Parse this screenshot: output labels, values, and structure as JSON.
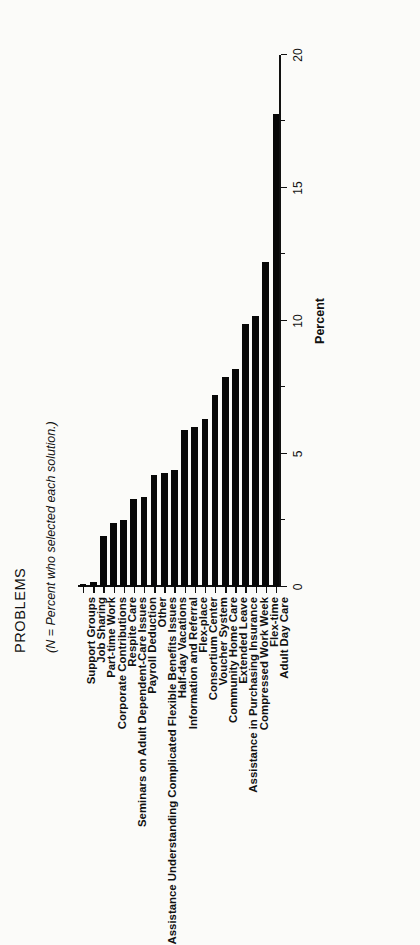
{
  "figure": {
    "title": "PROBLEMS",
    "subtitle": "(N = Percent who selected each solution.)"
  },
  "chart_data": {
    "type": "bar",
    "orientation": "horizontal",
    "title": "PROBLEMS",
    "subtitle": "(N = Percent who selected each solution.)",
    "xlabel": "",
    "ylabel": "Percent",
    "ylim": [
      0,
      20
    ],
    "yticks": [
      0,
      5,
      10,
      15,
      20
    ],
    "ytick_labels": [
      "0",
      "5",
      "10",
      "15",
      "20"
    ],
    "grid": false,
    "legend": false,
    "bar_color": "#080808",
    "categories": [
      "Adult Day Care",
      "Flex-time",
      "Compressed Work Week",
      "Assistance in Purchasing Insurance",
      "Extended Leave",
      "Community Home Care",
      "Voucher System",
      "Consortium Center",
      "Flex-place",
      "Information and Referral",
      "Half-day Vacations",
      "Assistance Understanding Complicated Flexible Benefits Issues",
      "Other",
      "Payroll Deduction",
      "Seminars on Adult Dependent-Care Issues",
      "Respite Care",
      "Corporate Contributions",
      "Part-time Work",
      "Job Sharing",
      "Support Groups"
    ],
    "values": [
      17.8,
      12.2,
      10.2,
      9.9,
      8.2,
      7.9,
      7.2,
      6.3,
      6.0,
      5.9,
      4.4,
      4.3,
      4.2,
      3.4,
      3.3,
      2.5,
      2.4,
      1.9,
      0.2,
      0.1
    ]
  }
}
